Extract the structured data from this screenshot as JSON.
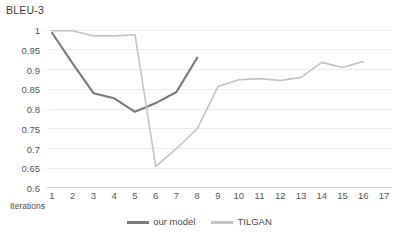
{
  "chart_data": {
    "type": "line",
    "title": "BLEU-3",
    "xlabel": "Iterations",
    "ylabel": "",
    "x": [
      1,
      2,
      3,
      4,
      5,
      6,
      7,
      8,
      9,
      10,
      11,
      12,
      13,
      14,
      15,
      16,
      17
    ],
    "categories": [
      "1",
      "2",
      "3",
      "4",
      "5",
      "6",
      "7",
      "8",
      "9",
      "10",
      "11",
      "12",
      "13",
      "14",
      "15",
      "16",
      "17"
    ],
    "xlim": [
      1,
      17
    ],
    "ylim": [
      0.6,
      1.0
    ],
    "yticks": [
      0.6,
      0.65,
      0.7,
      0.75,
      0.8,
      0.85,
      0.9,
      0.95,
      1
    ],
    "ytick_labels": [
      "0.6",
      "0.65",
      "0.7",
      "0.75",
      "0.8",
      "0.85",
      "0.9",
      "0.95",
      "1"
    ],
    "grid": true,
    "grid_axis": "y",
    "legend_position": "bottom",
    "series": [
      {
        "name": "our model",
        "color": "#7a7a7a",
        "x": [
          1,
          2,
          3,
          4,
          5,
          6,
          7,
          8
        ],
        "values": [
          0.993,
          0.915,
          0.84,
          0.827,
          0.793,
          0.815,
          0.843,
          0.93
        ]
      },
      {
        "name": "TILGAN",
        "color": "#c2c2c2",
        "x": [
          1,
          2,
          3,
          4,
          5,
          6,
          7,
          8,
          9,
          10,
          11,
          12,
          13,
          14,
          15,
          16
        ],
        "values": [
          0.998,
          0.998,
          0.985,
          0.985,
          0.988,
          0.655,
          0.7,
          0.75,
          0.857,
          0.874,
          0.877,
          0.872,
          0.88,
          0.918,
          0.905,
          0.92
        ]
      }
    ]
  },
  "axis": {
    "title": "BLEU-3",
    "x_title": "Iterations"
  },
  "legend": {
    "items": [
      {
        "label": "our model",
        "color": "#7a7a7a"
      },
      {
        "label": "TILGAN",
        "color": "#c2c2c2"
      }
    ]
  },
  "style": {
    "grid_color": "#ededed",
    "axis_line_color": "#d9d9d9",
    "text_color": "#555555",
    "background": "#ffffff"
  }
}
